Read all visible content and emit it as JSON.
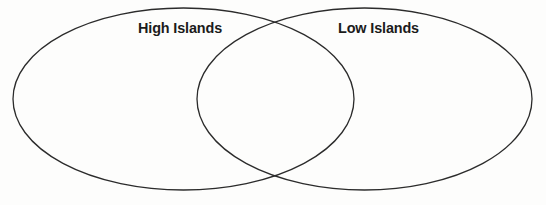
{
  "figure": {
    "type": "venn-diagram",
    "set_count": 2,
    "background_color": "#fdfdfc",
    "stroke_color": "#2b2b2b",
    "stroke_width": 1.3,
    "label_color": "#1b1b1b"
  },
  "labels": {
    "left_set": "High Islands",
    "right_set": "Low Islands"
  },
  "regions": {
    "left_only_text": "",
    "overlap_text": "",
    "right_only_text": ""
  },
  "geometry": {
    "left_ellipse": {
      "cx": 183.5,
      "cy": 99,
      "rx": 170.5,
      "ry": 91
    },
    "right_ellipse": {
      "cx": 364.5,
      "cy": 99,
      "rx": 167.5,
      "ry": 91
    }
  },
  "artifacts": {
    "ghost_center": "bleed-through",
    "ghost_right": "bleed-through",
    "ghost_bottom_left": "bleed-through",
    "ghost_bottom_right": "bleed-through"
  }
}
